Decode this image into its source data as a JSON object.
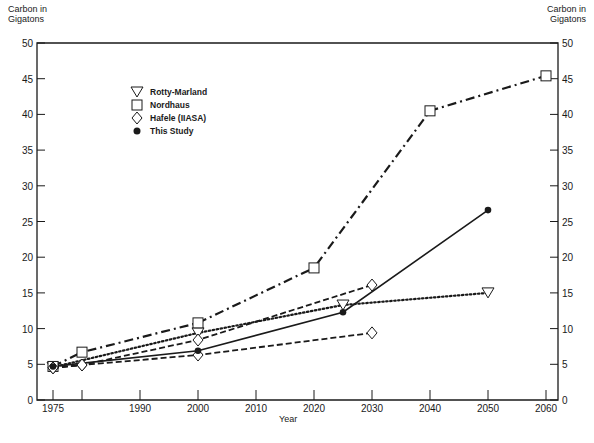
{
  "chart_data": {
    "type": "line",
    "title": "",
    "xlabel": "Year",
    "ylabel": "Carbon in Gigatons",
    "ylabel_right": "Carbon in Gigatons",
    "xlim": [
      1975,
      2062
    ],
    "ylim": [
      0,
      50
    ],
    "x_ticks": [
      1975,
      1980,
      1990,
      2000,
      2010,
      2020,
      2030,
      2040,
      2050,
      2060
    ],
    "x_tick_labels": [
      "1975",
      "",
      "1990",
      "2000",
      "2010",
      "2020",
      "2030",
      "2040",
      "2050",
      "2060"
    ],
    "y_ticks": [
      0,
      5,
      10,
      15,
      20,
      25,
      30,
      35,
      40,
      45,
      50
    ],
    "grid": false,
    "legend_position": "upper-left",
    "series": [
      {
        "name": "Rotty-Marland",
        "marker": "triangle-down",
        "line_style": "dotted",
        "x": [
          1975,
          2000,
          2025,
          2050
        ],
        "values": [
          4.6,
          9.4,
          13.3,
          15.0
        ]
      },
      {
        "name": "Nordhaus",
        "marker": "square",
        "line_style": "dash-dot",
        "x": [
          1975,
          1980,
          2000,
          2020,
          2040,
          2060
        ],
        "values": [
          4.7,
          6.7,
          10.8,
          18.5,
          40.5,
          45.4
        ]
      },
      {
        "name": "Hafele (IIASA) high",
        "marker": "diamond",
        "line_style": "dashed",
        "x": [
          1975,
          1980,
          2000,
          2030
        ],
        "values": [
          4.5,
          4.9,
          8.4,
          16.1
        ]
      },
      {
        "name": "Hafele (IIASA) low",
        "marker": "diamond",
        "line_style": "dashed",
        "x": [
          1975,
          1980,
          2000,
          2030
        ],
        "values": [
          4.5,
          4.9,
          6.3,
          9.4
        ]
      },
      {
        "name": "This Study",
        "marker": "filled-circle",
        "line_style": "solid",
        "x": [
          1975,
          2000,
          2025,
          2050
        ],
        "values": [
          4.7,
          6.9,
          12.3,
          26.6
        ]
      }
    ]
  },
  "legend": {
    "items": [
      {
        "label": "Rotty-Marland",
        "icon": "triangle-down-icon"
      },
      {
        "label": "Nordhaus",
        "icon": "square-icon"
      },
      {
        "label": "Hafele (IIASA)",
        "icon": "diamond-icon"
      },
      {
        "label": "This Study",
        "icon": "filled-circle-icon"
      }
    ]
  },
  "axes": {
    "left_title_line1": "Carbon in",
    "left_title_line2": "Gigatons",
    "right_title_line1": "Carbon in",
    "right_title_line2": "Gigatons",
    "x_title": "Year"
  },
  "colors": {
    "ink": "#1a1a1a",
    "background": "#ffffff"
  }
}
